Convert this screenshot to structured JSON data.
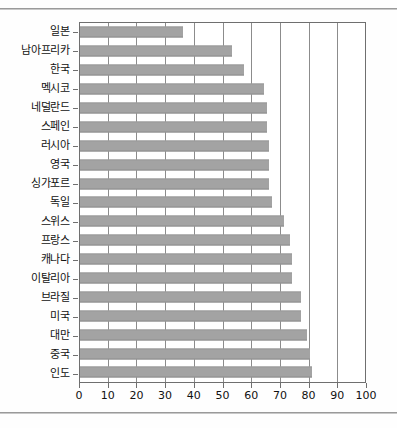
{
  "chart_data": {
    "type": "bar",
    "orientation": "horizontal",
    "title": "",
    "subtitle": "",
    "xlabel": "",
    "ylabel": "",
    "xlim": [
      0,
      100
    ],
    "xticks": [
      0,
      10,
      20,
      30,
      40,
      50,
      60,
      70,
      80,
      90,
      100
    ],
    "grid": true,
    "grid_axis": "x",
    "legend": false,
    "bar_color": "#a3a3a3",
    "axis_color": "#6f6f6f",
    "background": "#ffffff",
    "categories": [
      "일본",
      "남아프리카",
      "한국",
      "멕시코",
      "네덜란드",
      "스페인",
      "러시아",
      "영국",
      "싱가포르",
      "독일",
      "스위스",
      "프랑스",
      "캐나다",
      "이탈리아",
      "브라질",
      "미국",
      "대만",
      "중국",
      "인도"
    ],
    "values": [
      36,
      53,
      57,
      64,
      65,
      65,
      66,
      66,
      66,
      67,
      71,
      73,
      74,
      74,
      77,
      77,
      79,
      80,
      81
    ]
  }
}
